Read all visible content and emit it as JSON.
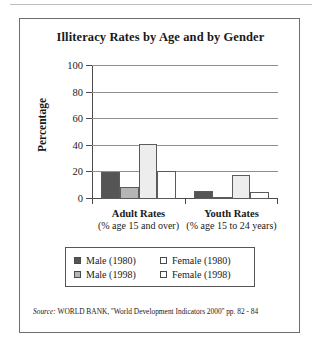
{
  "chart_data": {
    "type": "bar",
    "title": "Illiteracy Rates by Age and by Gender",
    "xlabel": "",
    "ylabel": "Percentage",
    "ylim": [
      0,
      100
    ],
    "yticks": [
      0,
      20,
      40,
      60,
      80,
      100
    ],
    "grid": true,
    "legend_position": "bottom",
    "categories": [
      "Adult Rates",
      "Youth Rates"
    ],
    "category_sublabels": [
      "(% age 15 and over)",
      "(% age 15 to 24 years)"
    ],
    "series": [
      {
        "name": "Male (1980)",
        "values": [
          20,
          6
        ],
        "color": "#555555"
      },
      {
        "name": "Male (1998)",
        "values": [
          9,
          1
        ],
        "color": "#b5b5b5"
      },
      {
        "name": "Female (1980)",
        "values": [
          41,
          18
        ],
        "color": "#ededed"
      },
      {
        "name": "Female (1998)",
        "values": [
          21,
          5
        ],
        "color": "#ffffff"
      }
    ],
    "source": "Source: WORLD BANK, ''World Development Indicators 2000'' pp. 82 - 84",
    "source_keyword": "Source:",
    "source_rest": " WORLD BANK, ''World Development Indicators 2000'' pp. 82 - 84"
  },
  "legend": {
    "entries": [
      {
        "label": "Male (1980)"
      },
      {
        "label": "Female (1980)"
      },
      {
        "label": "Male (1998)"
      },
      {
        "label": "Female (1998)"
      }
    ]
  }
}
